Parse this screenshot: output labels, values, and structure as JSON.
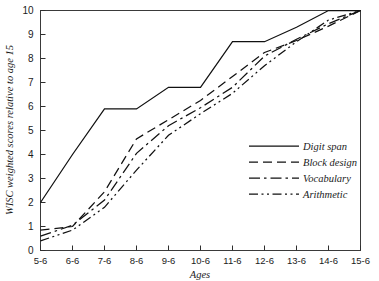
{
  "chart_data": {
    "type": "line",
    "title": "",
    "subtitle": "",
    "xlabel": "Ages",
    "ylabel": "WISC weighted scores relative to age 15",
    "categories": [
      "5-6",
      "6-6",
      "7-6",
      "8-6",
      "9-6",
      "10-6",
      "11-6",
      "12-6",
      "13-6",
      "14-6",
      "15-6"
    ],
    "xlim": [
      0,
      10
    ],
    "ylim": [
      0,
      10
    ],
    "yticks": [
      0,
      1,
      2,
      3,
      4,
      5,
      6,
      7,
      8,
      9,
      10
    ],
    "ytick_labels": [
      "0",
      "1",
      "2",
      "3",
      "4",
      "5",
      "6",
      "7",
      "8",
      "9",
      "10"
    ],
    "grid": false,
    "legend_position": "lower-right",
    "series": [
      {
        "name": "Digit span",
        "dash": "solid",
        "values": [
          2.0,
          4.0,
          5.9,
          5.9,
          6.8,
          6.8,
          8.7,
          8.7,
          9.3,
          10.0,
          10.0
        ]
      },
      {
        "name": "Block design",
        "dash": "dashed",
        "values": [
          0.85,
          1.0,
          2.45,
          4.65,
          5.45,
          6.25,
          7.25,
          8.25,
          8.75,
          9.35,
          10.0
        ]
      },
      {
        "name": "Vocabulary",
        "dash": "dash-dot",
        "values": [
          0.6,
          1.05,
          2.1,
          4.05,
          5.2,
          5.95,
          6.8,
          8.1,
          8.8,
          9.45,
          10.0
        ]
      },
      {
        "name": "Arithmetic",
        "dash": "dash-dot-dot",
        "values": [
          0.4,
          0.85,
          1.8,
          3.35,
          4.8,
          5.7,
          6.55,
          7.7,
          8.7,
          9.6,
          10.0
        ]
      }
    ]
  },
  "colors": {
    "line": "#111111",
    "axis": "#3a3a3a",
    "text": "#1b1b1b",
    "background": "#ffffff"
  },
  "legend": {
    "entries": [
      {
        "label": "Digit span"
      },
      {
        "label": "Block design"
      },
      {
        "label": "Vocabulary"
      },
      {
        "label": "Arithmetic"
      }
    ]
  }
}
